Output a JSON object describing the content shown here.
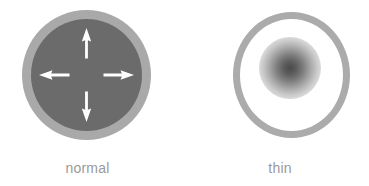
{
  "figure": {
    "width": 369,
    "height": 186,
    "background_color": "#ffffff"
  },
  "panels": [
    {
      "id": "normal",
      "caption": "normal",
      "caption_color": "#999999",
      "shape": "concentric-circles",
      "outer_ring": {
        "name": "outer-ring",
        "color": "#a9a9a9",
        "thickness_px": 9
      },
      "inner_disc": {
        "name": "inner-disc",
        "color": "#6b6b6b"
      },
      "arrows": {
        "color": "#ffffff",
        "count": 4,
        "directions": [
          "up",
          "right",
          "down",
          "left"
        ],
        "meaning": "outward expansion"
      }
    },
    {
      "id": "thin",
      "caption": "thin",
      "caption_color": "#999999",
      "shape": "ring-with-center-blob",
      "outer_ring": {
        "name": "outer-ring",
        "color": "#ababab",
        "thickness_px": 7
      },
      "interior": {
        "name": "interior-fill",
        "color": "#ffffff"
      },
      "center_blob": {
        "name": "center-blob",
        "center_color": "#4a4a4a",
        "edge_color": "#ffffff",
        "style": "soft radial gradient"
      },
      "arrows": {
        "count": 0
      }
    }
  ],
  "colors": {
    "light_gray_ring": "#a9a9a9",
    "dark_gray_core": "#6b6b6b",
    "arrow_white": "#ffffff",
    "caption_gray": "#999999",
    "blob_center": "#4a4a4a",
    "background": "#ffffff"
  }
}
